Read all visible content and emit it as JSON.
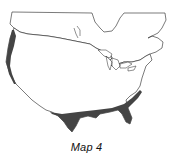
{
  "map": {
    "caption": "Map 4",
    "region": "North America (United States and southern Canada)",
    "shaded_regions": [
      {
        "name": "Pacific coast strip",
        "color": "#444444"
      },
      {
        "name": "Gulf coast and southern border strip",
        "color": "#444444"
      }
    ],
    "outline_color": "#222222",
    "land_color": "#ffffff"
  }
}
